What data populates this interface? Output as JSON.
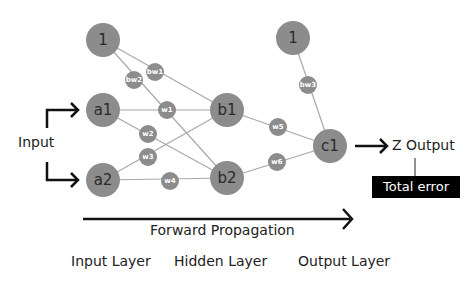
{
  "diagram": {
    "colors": {
      "node_fill": "#8c8c8c",
      "weight_fill": "#8c8c8c",
      "edge": "#a8a8a8",
      "arrow": "#111111",
      "error_box": "#000000",
      "error_text": "#ffffff"
    },
    "nodes": [
      {
        "id": "bias1",
        "label": "1",
        "layer": "input-bias"
      },
      {
        "id": "a1",
        "label": "a1",
        "layer": "input"
      },
      {
        "id": "a2",
        "label": "a2",
        "layer": "input"
      },
      {
        "id": "b1",
        "label": "b1",
        "layer": "hidden"
      },
      {
        "id": "b2",
        "label": "b2",
        "layer": "hidden"
      },
      {
        "id": "bias2",
        "label": "1",
        "layer": "hidden-bias"
      },
      {
        "id": "c1",
        "label": "c1",
        "layer": "output"
      }
    ],
    "weights": [
      {
        "label": "bw1",
        "from": "bias1",
        "to": "b1"
      },
      {
        "label": "bw2",
        "from": "bias1",
        "to": "b2"
      },
      {
        "label": "w1",
        "from": "a1",
        "to": "b1"
      },
      {
        "label": "w2",
        "from": "a1",
        "to": "b2"
      },
      {
        "label": "w3",
        "from": "a2",
        "to": "b1"
      },
      {
        "label": "w4",
        "from": "a2",
        "to": "b2"
      },
      {
        "label": "bw3",
        "from": "bias2",
        "to": "c1"
      },
      {
        "label": "w5",
        "from": "b1",
        "to": "c1"
      },
      {
        "label": "w6",
        "from": "b2",
        "to": "c1"
      }
    ],
    "input_label": "Input",
    "output_label": "Z Output",
    "error_label": "Total error",
    "forward_label": "Forward Propagation",
    "layers": {
      "input": "Input Layer",
      "hidden": "Hidden Layer",
      "output": "Output Layer"
    }
  }
}
